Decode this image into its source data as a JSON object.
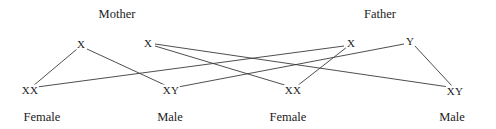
{
  "diagram": {
    "type": "pedigree-punnett-crossing",
    "canvas": {
      "width": 496,
      "height": 129,
      "background": "#ffffff"
    },
    "line_color": "#3a3a3a",
    "text_color": "#222222",
    "parents": [
      {
        "id": "mother",
        "label": "Mother",
        "x": 117,
        "y": 14
      },
      {
        "id": "father",
        "label": "Father",
        "x": 380,
        "y": 14
      }
    ],
    "gametes": [
      {
        "id": "mother-x-left",
        "label": "X",
        "x": 81,
        "y": 44,
        "parent": "mother"
      },
      {
        "id": "mother-x-right",
        "label": "X",
        "x": 148,
        "y": 43,
        "parent": "mother"
      },
      {
        "id": "father-x",
        "label": "X",
        "x": 351,
        "y": 43,
        "parent": "father"
      },
      {
        "id": "father-y",
        "label": "Y",
        "x": 410,
        "y": 41,
        "parent": "father"
      }
    ],
    "offspring": [
      {
        "id": "child-1",
        "genotype": "XX",
        "sex": "Female",
        "x": 30,
        "y": 90,
        "sex_x": 42,
        "sex_y": 117
      },
      {
        "id": "child-2",
        "genotype": "XY",
        "sex": "Male",
        "x": 171,
        "y": 90,
        "sex_x": 170,
        "sex_y": 117
      },
      {
        "id": "child-3",
        "genotype": "XX",
        "sex": "Female",
        "x": 293,
        "y": 90,
        "sex_x": 288,
        "sex_y": 117
      },
      {
        "id": "child-4",
        "genotype": "XY",
        "sex": "Male",
        "x": 455,
        "y": 91,
        "sex_x": 452,
        "sex_y": 117
      }
    ],
    "connections": [
      {
        "id": "conn-mx1-c1",
        "from": "mother-x-left",
        "to": "child-1",
        "x1": 77,
        "y1": 49,
        "x2": 33,
        "y2": 86
      },
      {
        "id": "conn-mx1-c2",
        "from": "mother-x-left",
        "to": "child-2",
        "x1": 87,
        "y1": 49,
        "x2": 167,
        "y2": 86
      },
      {
        "id": "conn-mx2-c3",
        "from": "mother-x-right",
        "to": "child-3",
        "x1": 155,
        "y1": 46,
        "x2": 288,
        "y2": 86
      },
      {
        "id": "conn-mx2-c4",
        "from": "mother-x-right",
        "to": "child-4",
        "x1": 155,
        "y1": 44,
        "x2": 449,
        "y2": 87
      },
      {
        "id": "conn-fx-c1",
        "from": "father-x",
        "to": "child-1",
        "x1": 344,
        "y1": 46,
        "x2": 37,
        "y2": 87
      },
      {
        "id": "conn-fx-c3",
        "from": "father-x",
        "to": "child-3",
        "x1": 347,
        "y1": 47,
        "x2": 297,
        "y2": 86
      },
      {
        "id": "conn-fy-c2",
        "from": "father-y",
        "to": "child-2",
        "x1": 404,
        "y1": 44,
        "x2": 178,
        "y2": 87
      },
      {
        "id": "conn-fy-c4",
        "from": "father-y",
        "to": "child-4",
        "x1": 414,
        "y1": 45,
        "x2": 452,
        "y2": 86
      }
    ]
  }
}
